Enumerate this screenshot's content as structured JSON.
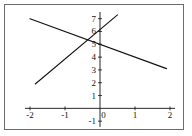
{
  "chart_data": {
    "type": "line",
    "title": "",
    "xlabel": "",
    "ylabel": "",
    "xlim": [
      -2.2,
      2.2
    ],
    "ylim": [
      -1.3,
      7.6
    ],
    "grid": false,
    "legend": false,
    "x_ticks": [
      -2,
      -1,
      0,
      1,
      2
    ],
    "x_tick_labels": [
      "-2",
      "-1",
      "0",
      "1",
      "2"
    ],
    "y_ticks": [
      -1,
      1,
      2,
      3,
      4,
      5,
      6,
      7
    ],
    "y_tick_labels": [
      "-1",
      "1",
      "2",
      "3",
      "4",
      "5",
      "6",
      "7"
    ],
    "origin_label": "0",
    "axis_color": "#111111",
    "line_color": "#111111",
    "background_color": "#ffffff",
    "border_color": "#6b6b6b",
    "series": [
      {
        "name": "decreasing-line",
        "slope": -1.0,
        "intercept": 5.0,
        "points": [
          [
            -2,
            7.0
          ],
          [
            1.9,
            3.1
          ]
        ]
      },
      {
        "name": "increasing-line",
        "slope": 2.3,
        "intercept": 6.15,
        "points": [
          [
            -1.85,
            1.9
          ],
          [
            0.5,
            7.3
          ]
        ]
      }
    ],
    "intersection": [
      -0.2,
      5.3
    ]
  }
}
